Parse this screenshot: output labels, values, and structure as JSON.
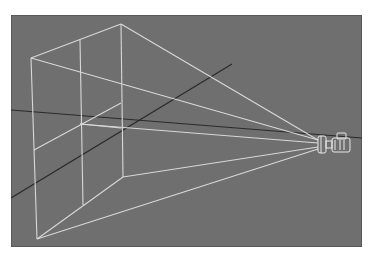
{
  "viewport": {
    "name": "Perspective",
    "background": "#6f6f6f",
    "grid_axis_color": "#2a2a2a",
    "wireframe_color": "#d8d8d8",
    "objects": [
      {
        "type": "camera",
        "label": "camera",
        "position": [
          330,
          132
        ]
      },
      {
        "type": "frustum",
        "label": "camera-frustum"
      },
      {
        "type": "axis-line",
        "label": "world-axis-x"
      },
      {
        "type": "axis-line",
        "label": "world-axis-y"
      }
    ]
  }
}
